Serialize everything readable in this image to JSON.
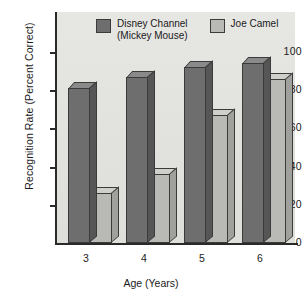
{
  "chart_data": {
    "type": "bar",
    "title": "",
    "xlabel": "Age (Years)",
    "ylabel": "Recognition Rate (Percent Correct)",
    "categories": [
      "3",
      "4",
      "5",
      "6"
    ],
    "ylim": [
      0,
      100
    ],
    "yticks": [
      "0",
      "20",
      "40",
      "60",
      "80",
      "100"
    ],
    "grid": false,
    "legend_position": "top",
    "series": [
      {
        "name": "Disney Channel\n(Mickey Mouse)",
        "color": "#6e6e6e",
        "values": [
          81,
          87,
          92,
          94
        ]
      },
      {
        "name": "Joe Camel",
        "color": "#b9b9b6",
        "values": [
          26,
          36,
          67,
          86
        ]
      }
    ]
  },
  "figure": {
    "background": "#ffffff",
    "panel_background": "#e3e3e0",
    "axis_color": "#2a2a2a"
  }
}
